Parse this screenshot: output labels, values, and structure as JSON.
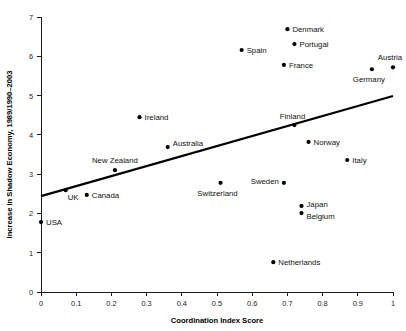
{
  "chart_data": {
    "type": "scatter",
    "title": "",
    "xlabel": "Coordination Index Score",
    "ylabel": "Increase in Shadow Economy, 1989/1990–2003",
    "xlim": [
      0,
      1
    ],
    "ylim": [
      0,
      7
    ],
    "xticks": [
      "0",
      "0.1",
      "0.2",
      "0.3",
      "0.4",
      "0.5",
      "0.6",
      "0.7",
      "0.8",
      "0.9",
      "1"
    ],
    "xtick_values": [
      0,
      0.1,
      0.2,
      0.3,
      0.4,
      0.5,
      0.6,
      0.7,
      0.8,
      0.9,
      1
    ],
    "yticks": [
      "0",
      "1",
      "2",
      "3",
      "4",
      "5",
      "6",
      "7"
    ],
    "ytick_values": [
      0,
      1,
      2,
      3,
      4,
      5,
      6,
      7
    ],
    "grid": false,
    "legend": false,
    "point_color": "#000000",
    "line_color": "#000000",
    "trendline": {
      "x0": 0,
      "y0": 2.44,
      "x1": 1,
      "y1": 4.99
    },
    "points": [
      {
        "label": "USA",
        "x": 0.0,
        "y": 1.78,
        "label_dx": 5,
        "label_dy": 3,
        "anchor": "start"
      },
      {
        "label": "UK",
        "x": 0.07,
        "y": 2.59,
        "label_dx": 2,
        "label_dy": 10,
        "anchor": "start"
      },
      {
        "label": "Canada",
        "x": 0.13,
        "y": 2.47,
        "label_dx": 5,
        "label_dy": 3,
        "anchor": "start"
      },
      {
        "label": "New Zealand",
        "x": 0.21,
        "y": 3.1,
        "label_dx": 0,
        "label_dy": -7,
        "anchor": "middle"
      },
      {
        "label": "Ireland",
        "x": 0.28,
        "y": 4.45,
        "label_dx": 5,
        "label_dy": 3,
        "anchor": "start"
      },
      {
        "label": "Australia",
        "x": 0.36,
        "y": 3.69,
        "label_dx": 5,
        "label_dy": -1,
        "anchor": "start"
      },
      {
        "label": "Switzerland",
        "x": 0.51,
        "y": 2.78,
        "label_dx": -3,
        "label_dy": 13,
        "anchor": "middle"
      },
      {
        "label": "Spain",
        "x": 0.57,
        "y": 6.16,
        "label_dx": 5,
        "label_dy": 3,
        "anchor": "start"
      },
      {
        "label": "Netherlands",
        "x": 0.66,
        "y": 0.76,
        "label_dx": 5,
        "label_dy": 3,
        "anchor": "start"
      },
      {
        "label": "France",
        "x": 0.69,
        "y": 5.78,
        "label_dx": 5,
        "label_dy": 3,
        "anchor": "start"
      },
      {
        "label": "Denmark",
        "x": 0.7,
        "y": 6.69,
        "label_dx": 5,
        "label_dy": 3,
        "anchor": "start"
      },
      {
        "label": "Sweden",
        "x": 0.69,
        "y": 2.78,
        "label_dx": -5,
        "label_dy": 1,
        "anchor": "end"
      },
      {
        "label": "Finland",
        "x": 0.72,
        "y": 4.25,
        "label_dx": -2,
        "label_dy": -6,
        "anchor": "middle"
      },
      {
        "label": "Japan",
        "x": 0.74,
        "y": 2.19,
        "label_dx": 5,
        "label_dy": 1,
        "anchor": "start"
      },
      {
        "label": "Belgium",
        "x": 0.74,
        "y": 2.01,
        "label_dx": 5,
        "label_dy": 6,
        "anchor": "start"
      },
      {
        "label": "Portugal",
        "x": 0.72,
        "y": 6.31,
        "label_dx": 5,
        "label_dy": 3,
        "anchor": "start"
      },
      {
        "label": "Norway",
        "x": 0.76,
        "y": 3.82,
        "label_dx": 5,
        "label_dy": 3,
        "anchor": "start"
      },
      {
        "label": "Italy",
        "x": 0.87,
        "y": 3.36,
        "label_dx": 5,
        "label_dy": 3,
        "anchor": "start"
      },
      {
        "label": "Germany",
        "x": 0.94,
        "y": 5.67,
        "label_dx": -3,
        "label_dy": 13,
        "anchor": "middle"
      },
      {
        "label": "Austria",
        "x": 1.0,
        "y": 5.72,
        "label_dx": -3,
        "label_dy": -7,
        "anchor": "middle"
      }
    ]
  }
}
